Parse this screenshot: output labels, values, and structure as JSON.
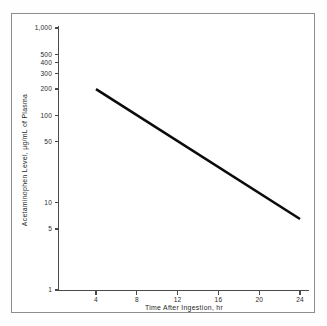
{
  "figure": {
    "background_color": "#ffffff",
    "border_color": "#8d8d8d",
    "line_color": "#0b0b0b",
    "axis_color": "#4a4a4a"
  },
  "chart_data": {
    "type": "line",
    "title": "",
    "subtitle": "",
    "xlabel": "Time After Ingestion, hr",
    "ylabel": "Acetaminophen Level, µg/mL of Plasma",
    "xscale": "linear",
    "yscale": "log",
    "xlim": [
      0,
      26
    ],
    "ylim": [
      1,
      1000
    ],
    "grid": false,
    "legend": false,
    "legend_position": "none",
    "x_ticks": [
      4,
      8,
      12,
      16,
      20,
      24
    ],
    "x_tick_labels": [
      "4",
      "8",
      "12",
      "16",
      "20",
      "24"
    ],
    "y_ticks": [
      1,
      5,
      10,
      50,
      100,
      200,
      300,
      400,
      500,
      1000
    ],
    "y_tick_labels": [
      "1",
      "5",
      "10",
      "50",
      "100",
      "200",
      "300",
      "400",
      "500",
      "1,000"
    ],
    "series": [
      {
        "name": "Acetaminophen plasma level",
        "x": [
          4,
          24
        ],
        "values": [
          200,
          6.5
        ],
        "annotations": []
      }
    ]
  },
  "y_axis_ticks": [
    {
      "value": 1000,
      "label": "1,000"
    },
    {
      "value": 500,
      "label": "500"
    },
    {
      "value": 400,
      "label": "400"
    },
    {
      "value": 300,
      "label": "300"
    },
    {
      "value": 200,
      "label": "200"
    },
    {
      "value": 100,
      "label": "100"
    },
    {
      "value": 50,
      "label": "50"
    },
    {
      "value": 10,
      "label": "10"
    },
    {
      "value": 5,
      "label": "5"
    },
    {
      "value": 1,
      "label": "1"
    }
  ],
  "x_axis_ticks": [
    {
      "value": 4,
      "label": "4"
    },
    {
      "value": 8,
      "label": "8"
    },
    {
      "value": 12,
      "label": "12"
    },
    {
      "value": 16,
      "label": "16"
    },
    {
      "value": 20,
      "label": "20"
    },
    {
      "value": 24,
      "label": "24"
    }
  ],
  "labels": {
    "y_axis_title": "Acetaminophen Level, µg/mL of Plasma",
    "x_axis_title": "Time After Ingestion, hr"
  }
}
